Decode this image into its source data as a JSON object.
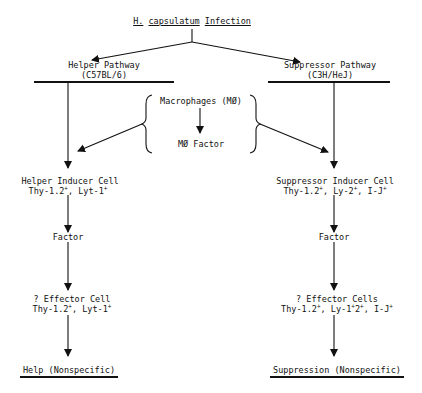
{
  "diagram": {
    "root": {
      "species": "H.",
      "genus": "capsulatum",
      "word": "Infection"
    },
    "helper": {
      "title": "Helper Pathway",
      "strain": "(C57BL/6)",
      "inducer": {
        "name": "Helper Inducer Cell",
        "markers": [
          "Thy-1.2",
          "Lyt-1"
        ]
      },
      "factor": "Factor",
      "effector": {
        "name": "? Effector Cell",
        "markers": [
          "Thy-1.2",
          "Lyt-1"
        ]
      },
      "outcome": "Help (Nonspecific)"
    },
    "suppressor": {
      "title": "Suppressor Pathway",
      "strain": "(C3H/HeJ)",
      "inducer": {
        "name": "Suppressor Inducer Cell",
        "markers": [
          "Thy-1.2",
          "Ly-2",
          "I-J"
        ]
      },
      "factor": "Factor",
      "effector": {
        "name": "? Effector Cells",
        "markers": [
          "Thy-1.2",
          "Ly-1",
          "2",
          "I-J"
        ]
      },
      "outcome": "Suppression (Nonspecific)"
    },
    "macrophage": {
      "cell": "Macrophages (MØ)",
      "factor": "MØ Factor"
    },
    "sup_plus": "+",
    "sep": ", "
  }
}
